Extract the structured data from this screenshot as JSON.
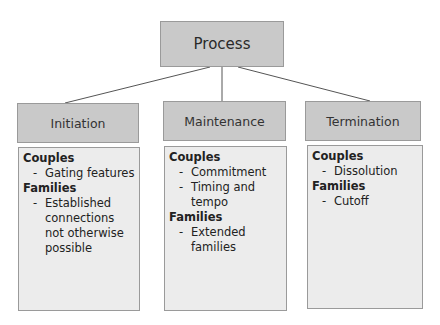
{
  "root": {
    "label": "Process"
  },
  "columns": [
    {
      "label": "Initiation",
      "groups": [
        {
          "title": "Couples",
          "items": [
            "Gating features"
          ]
        },
        {
          "title": "Families",
          "items": [
            "Established connections not otherwise possible"
          ]
        }
      ]
    },
    {
      "label": "Maintenance",
      "groups": [
        {
          "title": "Couples",
          "items": [
            "Commitment",
            "Timing and tempo"
          ]
        },
        {
          "title": "Families",
          "items": [
            "Extended families"
          ]
        }
      ]
    },
    {
      "label": "Termination",
      "groups": [
        {
          "title": "Couples",
          "items": [
            "Dissolution"
          ]
        },
        {
          "title": "Families",
          "items": [
            "Cutoff"
          ]
        }
      ]
    }
  ],
  "bullet": "-",
  "colors": {
    "header_fill": "#c9c9c9",
    "body_fill": "#ececec",
    "border": "#9a9a9a",
    "line": "#555555"
  }
}
